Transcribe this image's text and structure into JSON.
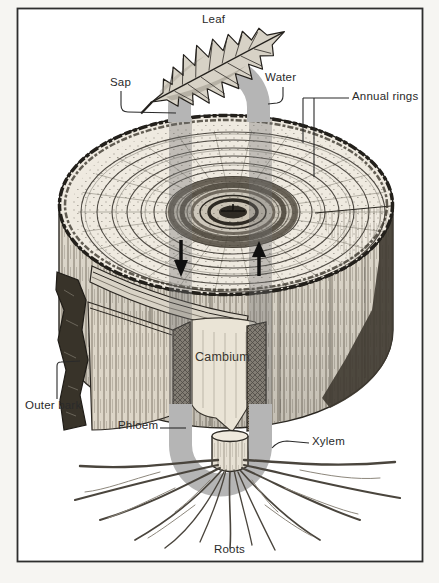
{
  "diagram": {
    "type": "tree-trunk-cross-section",
    "labels": {
      "leaf": "Leaf",
      "sap": "Sap",
      "water": "Water",
      "annual_rings": "Annual rings",
      "cambium": "Cambium",
      "outer_bark": "Outer bark",
      "phloem": "Phloem",
      "xylem": "Xylem",
      "roots": "Roots"
    },
    "icons": {
      "sap_flow": "down-arrow-icon",
      "water_flow": "up-arrow-icon"
    },
    "colors": {
      "flow_band": "#b5b5b5",
      "ink": "#2a2a2a",
      "frame_border": "#2e2e2e",
      "paper": "#ffffff",
      "wood_surface": "#efeae0",
      "bark": "#35302a"
    }
  }
}
